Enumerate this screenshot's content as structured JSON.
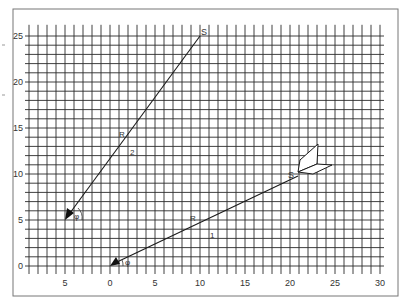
{
  "figure": {
    "frame": {
      "x": 13,
      "y": 9,
      "width": 385,
      "height": 287
    },
    "colors": {
      "grid": "#2a2a2a",
      "line": "#1a1a1a",
      "frame": "#777777",
      "text": "#333333",
      "background": "#ffffff"
    },
    "axes": {
      "x_range": [
        -9,
        30
      ],
      "y_range": [
        0,
        26
      ],
      "x_ticks": [
        {
          "value": -5,
          "label": "5"
        },
        {
          "value": 0,
          "label": "0"
        },
        {
          "value": 5,
          "label": "5"
        },
        {
          "value": 10,
          "label": "10"
        },
        {
          "value": 15,
          "label": "15"
        },
        {
          "value": 20,
          "label": "20"
        },
        {
          "value": 25,
          "label": "25"
        },
        {
          "value": 30,
          "label": "30"
        }
      ],
      "y_ticks": [
        {
          "value": 0,
          "label": "0"
        },
        {
          "value": 5,
          "label": "5"
        },
        {
          "value": 10,
          "label": "10"
        },
        {
          "value": 15,
          "label": "15"
        },
        {
          "value": 20,
          "label": "20"
        },
        {
          "value": 25,
          "label": "25"
        }
      ]
    },
    "vectors": [
      {
        "id": "1",
        "label": "1",
        "start_label": "S",
        "mid_label": "R",
        "angle_label": "φ",
        "from": [
          21,
          10
        ],
        "to": [
          0,
          0
        ]
      },
      {
        "id": "2",
        "label": "2",
        "start_label": "S",
        "mid_label": "R",
        "angle_label": "φ",
        "from": [
          10,
          25
        ],
        "to": [
          -5,
          5
        ]
      }
    ],
    "labels": {
      "s1": "S",
      "s2": "S",
      "r1": "R",
      "r2": "R",
      "n1": "1",
      "n2": "2",
      "phi1": "φ",
      "phi2": "φ"
    },
    "object": {
      "name": "folded-card",
      "anchor": [
        21,
        10
      ]
    }
  }
}
